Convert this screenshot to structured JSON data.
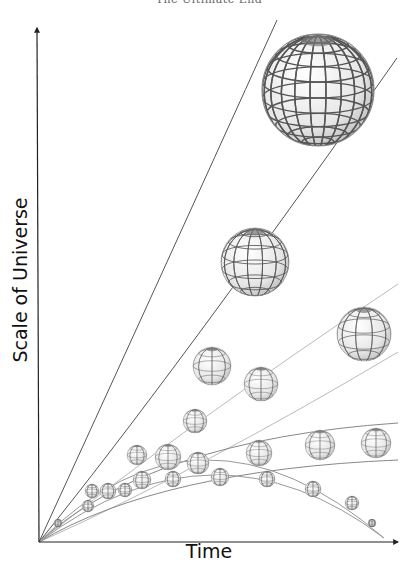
{
  "header": {
    "title": "The Ultimate End"
  },
  "axes": {
    "y_label": "Scale of Universe",
    "x_label": "Time",
    "origin": [
      39,
      542
    ],
    "y_axis_top": [
      37,
      28
    ],
    "x_axis_end": [
      398,
      542
    ],
    "color": "#222222"
  },
  "chart_data": {
    "type": "diagram",
    "title": "",
    "xlabel": "Time",
    "ylabel": "Scale of Universe",
    "scenarios": [
      {
        "name": "fast-acceleration",
        "envelope": [
          {
            "from": [
              39,
              542
            ],
            "ctrl": [
              150,
              300
            ],
            "to": [
              277,
              20
            ]
          },
          {
            "from": [
              39,
              542
            ],
            "ctrl": [
              170,
              380
            ],
            "to": [
              397,
              58
            ]
          }
        ],
        "line_color": "#555555",
        "spheres": [
          {
            "cx": 88,
            "cy": 506,
            "r": 6
          },
          {
            "cx": 137,
            "cy": 455,
            "r": 10
          },
          {
            "cx": 212,
            "cy": 366,
            "r": 19
          },
          {
            "cx": 255,
            "cy": 262,
            "r": 34
          },
          {
            "cx": 318,
            "cy": 90,
            "r": 56
          }
        ]
      },
      {
        "name": "moderate-acceleration",
        "envelope": [
          {
            "from": [
              39,
              542
            ],
            "ctrl": [
              180,
              430
            ],
            "to": [
              398,
              284
            ]
          },
          {
            "from": [
              39,
              542
            ],
            "ctrl": [
              200,
              470
            ],
            "to": [
              398,
              352
            ]
          }
        ],
        "line_color": "#bbbbbb",
        "spheres": [
          {
            "cx": 92,
            "cy": 491,
            "r": 7
          },
          {
            "cx": 168,
            "cy": 457,
            "r": 13
          },
          {
            "cx": 195,
            "cy": 421,
            "r": 12
          },
          {
            "cx": 261,
            "cy": 384,
            "r": 17
          },
          {
            "cx": 364,
            "cy": 334,
            "r": 27
          }
        ]
      },
      {
        "name": "steady-expansion",
        "envelope": [
          {
            "from": [
              39,
              542
            ],
            "ctrl": [
              150,
              440
            ],
            "to": [
              398,
              423
            ]
          },
          {
            "from": [
              39,
              542
            ],
            "ctrl": [
              160,
              470
            ],
            "to": [
              398,
              460
            ]
          }
        ],
        "line_color": "#888888",
        "spheres": [
          {
            "cx": 108,
            "cy": 491,
            "r": 8
          },
          {
            "cx": 142,
            "cy": 480,
            "r": 9
          },
          {
            "cx": 198,
            "cy": 463,
            "r": 11
          },
          {
            "cx": 259,
            "cy": 453,
            "r": 13
          },
          {
            "cx": 320,
            "cy": 445,
            "r": 15
          },
          {
            "cx": 376,
            "cy": 443,
            "r": 15
          }
        ]
      },
      {
        "name": "recollapse",
        "envelope": [
          {
            "from": [
              39,
              542
            ],
            "ctrl": [
              200,
              380
            ],
            "to": [
              384,
              538
            ]
          },
          {
            "from": [
              39,
              542
            ],
            "ctrl": [
              215,
              410
            ],
            "to": [
              384,
              538
            ]
          }
        ],
        "line_color": "#999999",
        "spheres": [
          {
            "cx": 58,
            "cy": 523,
            "r": 4
          },
          {
            "cx": 125,
            "cy": 490,
            "r": 7
          },
          {
            "cx": 173,
            "cy": 479,
            "r": 8
          },
          {
            "cx": 220,
            "cy": 477,
            "r": 9
          },
          {
            "cx": 267,
            "cy": 479,
            "r": 8
          },
          {
            "cx": 313,
            "cy": 489,
            "r": 8
          },
          {
            "cx": 352,
            "cy": 503,
            "r": 7
          },
          {
            "cx": 372,
            "cy": 523,
            "r": 4
          }
        ]
      }
    ],
    "sphere_style": {
      "fill": "#f2f2f2",
      "grid_color": "#555555",
      "pole_shade": "#777777"
    }
  }
}
